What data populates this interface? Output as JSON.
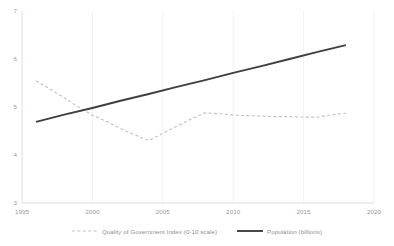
{
  "chart_data": {
    "type": "line",
    "title": "",
    "xlabel": "",
    "ylabel": "",
    "xlim": [
      1995,
      2020
    ],
    "ylim": [
      3,
      7
    ],
    "xticks": [
      "1995",
      "2000",
      "2005",
      "2010",
      "2015",
      "2020"
    ],
    "yticks": [
      "7",
      "6",
      "5",
      "4",
      "3"
    ],
    "grid": "vertical-only-faint",
    "legend_position": "bottom-center",
    "series": [
      {
        "name": "Quality of Government Index (0-10 scale)",
        "style": "dashed",
        "color": "#bfbfbf",
        "x": [
          1996,
          1997,
          1998,
          1999,
          2000,
          2001,
          2002,
          2003,
          2004,
          2005,
          2006,
          2007,
          2008,
          2009,
          2010,
          2011,
          2012,
          2013,
          2014,
          2015,
          2016,
          2017,
          2018
        ],
        "values": [
          5.55,
          5.37,
          5.19,
          5.0,
          4.83,
          4.7,
          4.55,
          4.42,
          4.3,
          4.45,
          4.6,
          4.75,
          4.88,
          4.86,
          4.83,
          4.82,
          4.81,
          4.8,
          4.8,
          4.79,
          4.79,
          4.84,
          4.87
        ]
      },
      {
        "name": "Population (billions)",
        "style": "solid",
        "color": "#3f3f3f",
        "x": [
          1996,
          1998,
          2000,
          2002,
          2004,
          2006,
          2008,
          2010,
          2012,
          2014,
          2016,
          2018
        ],
        "values": [
          4.69,
          4.84,
          4.98,
          5.13,
          5.27,
          5.42,
          5.56,
          5.71,
          5.85,
          6.0,
          6.15,
          6.29
        ]
      }
    ]
  },
  "ticks": {
    "y": [
      {
        "label": "7",
        "value": 7
      },
      {
        "label": "6",
        "value": 6
      },
      {
        "label": "5",
        "value": 5
      },
      {
        "label": "4",
        "value": 4
      },
      {
        "label": "3",
        "value": 3
      }
    ],
    "x": [
      {
        "label": "1995",
        "value": 1995
      },
      {
        "label": "2000",
        "value": 2000
      },
      {
        "label": "2005",
        "value": 2005
      },
      {
        "label": "2010",
        "value": 2010
      },
      {
        "label": "2015",
        "value": 2015
      },
      {
        "label": "2020",
        "value": 2020
      }
    ]
  },
  "legend": {
    "items": [
      {
        "label": "Quality of Government Index (0-10 scale)",
        "style": "dashed",
        "color": "#bfbfbf"
      },
      {
        "label": "Population (billions)",
        "style": "solid",
        "color": "#3f3f3f"
      }
    ]
  }
}
